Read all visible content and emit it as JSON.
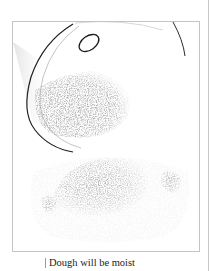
{
  "figure": {
    "illustration": "glass-bowl-tipped-with-dough-crumbs",
    "caption": "Dough will be moist"
  },
  "colors": {
    "frame_border": "#c4c4c4",
    "ink": "#222222",
    "crumbs": "#7a7a7a",
    "background": "#ffffff"
  }
}
